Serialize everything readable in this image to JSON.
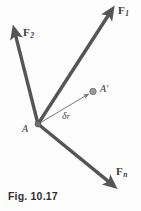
{
  "figure": {
    "caption": "Fig. 10.17",
    "background_color": "#fdfdfd",
    "line_color": "#555555",
    "thin_line_color": "#7a7a7a",
    "label_color": "#3b3b3b"
  },
  "points": [
    {
      "id": "A",
      "label": "A",
      "x": 38,
      "y": 124,
      "marker": "filled-circle",
      "marker_color": "#6b6b6b",
      "radius": 3.0
    },
    {
      "id": "Aprime",
      "label": "A′",
      "x": 93,
      "y": 92,
      "marker": "filled-circle",
      "marker_color": "#8a8a8a",
      "radius": 3.2
    }
  ],
  "vectors": [
    {
      "id": "F1",
      "label": "F",
      "subscript": "1",
      "from_x": 38,
      "from_y": 124,
      "to_x": 113,
      "to_y": 9,
      "width": 3.4,
      "color": "#555555",
      "arrowhead": true
    },
    {
      "id": "F2",
      "label": "F",
      "subscript": "2",
      "from_x": 38,
      "from_y": 124,
      "to_x": 14,
      "to_y": 29,
      "width": 3.4,
      "color": "#555555",
      "arrowhead": true
    },
    {
      "id": "Fn",
      "label": "F",
      "subscript": "n",
      "from_x": 38,
      "from_y": 124,
      "to_x": 114,
      "to_y": 186,
      "width": 3.4,
      "color": "#555555",
      "arrowhead": true
    },
    {
      "id": "dr",
      "label": "δ",
      "subscript": "r",
      "from_x": 38,
      "from_y": 124,
      "to_x": 92,
      "to_y": 92,
      "width": 1.0,
      "color": "#7a7a7a",
      "arrowhead": true
    }
  ],
  "labels": {
    "F1": {
      "base": "F",
      "sub": "1"
    },
    "F2": {
      "base": "F",
      "sub": "2"
    },
    "Fn": {
      "base": "F",
      "sub": "n"
    },
    "A": "A",
    "Aprime": "A′",
    "dr": {
      "base": "δ",
      "sub": "r"
    }
  }
}
